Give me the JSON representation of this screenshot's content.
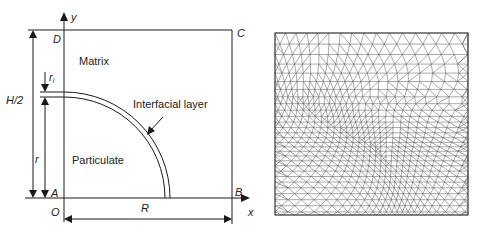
{
  "schematic": {
    "axis_y_label": "y",
    "axis_x_label": "x",
    "corner_labels": {
      "top_left": "D",
      "top_right": "C",
      "bottom_left": "A",
      "bottom_right": "B",
      "origin": "O"
    },
    "region_matrix": "Matrix",
    "region_particulate": "Particulate",
    "interfacial_layer_label": "Interfacial layer",
    "dimension_half_height": "H/2",
    "dimension_radius_particle": "r",
    "dimension_interface_thickness": "r",
    "dimension_interface_thickness_sub": "i",
    "dimension_width": "R"
  },
  "mesh": {
    "description": "Triangular finite element mesh of the quarter-cell model"
  },
  "colors": {
    "line": "#1a1a1a",
    "mesh_line": "#444444",
    "background": "#ffffff"
  }
}
